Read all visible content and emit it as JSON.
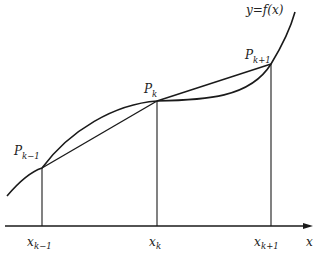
{
  "figure": {
    "type": "trapezoidal-rule-illustration",
    "curve_label": "y=f(x)",
    "axis_label": "x",
    "points": [
      {
        "label_base": "P",
        "label_sub": "k−1",
        "x_label_base": "x",
        "x_label_sub": "k−1"
      },
      {
        "label_base": "P",
        "label_sub": "k",
        "x_label_base": "x",
        "x_label_sub": "k"
      },
      {
        "label_base": "P",
        "label_sub": "k+1",
        "x_label_base": "x",
        "x_label_sub": "k+1"
      }
    ],
    "colors": {
      "stroke": "#1a1a1a",
      "background": "#ffffff"
    }
  }
}
